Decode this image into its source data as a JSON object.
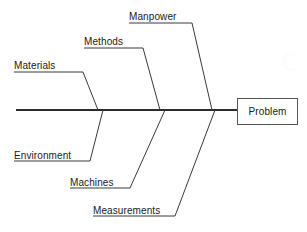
{
  "diagram": {
    "type": "fishbone-ishikawa",
    "effect": {
      "label": "Problem",
      "box": {
        "x": 237,
        "y": 98,
        "width": 61,
        "height": 27
      }
    },
    "spine": {
      "x_start": 16,
      "x_end": 237,
      "y": 110,
      "color": "#2b2b2b",
      "thickness": 2
    },
    "line_color": "#3a3a3a",
    "branch_thickness": 1,
    "categories": [
      {
        "id": "materials",
        "label": "Materials",
        "side": "top",
        "text_x": 14,
        "text_y": 60,
        "underline_y": 72,
        "underline_x_start": 14,
        "underline_x_end": 83,
        "spine_x": 98
      },
      {
        "id": "methods",
        "label": "Methods",
        "side": "top",
        "text_x": 84,
        "text_y": 36,
        "underline_y": 48,
        "underline_x_start": 84,
        "underline_x_end": 143,
        "spine_x": 160
      },
      {
        "id": "manpower",
        "label": "Manpower",
        "side": "top",
        "text_x": 129,
        "text_y": 11,
        "underline_y": 23,
        "underline_x_start": 129,
        "underline_x_end": 192,
        "spine_x": 212
      },
      {
        "id": "environment",
        "label": "Environment",
        "side": "bottom",
        "text_x": 14,
        "text_y": 150,
        "underline_y": 161,
        "underline_x_start": 14,
        "underline_x_end": 90,
        "spine_x": 103
      },
      {
        "id": "machines",
        "label": "Machines",
        "side": "bottom",
        "text_x": 70,
        "text_y": 177,
        "underline_y": 188,
        "underline_x_start": 70,
        "underline_x_end": 130,
        "spine_x": 165
      },
      {
        "id": "measurements",
        "label": "Measurements",
        "side": "bottom",
        "text_x": 93,
        "text_y": 205,
        "underline_y": 216,
        "underline_x_start": 93,
        "underline_x_end": 175,
        "spine_x": 215
      }
    ]
  }
}
